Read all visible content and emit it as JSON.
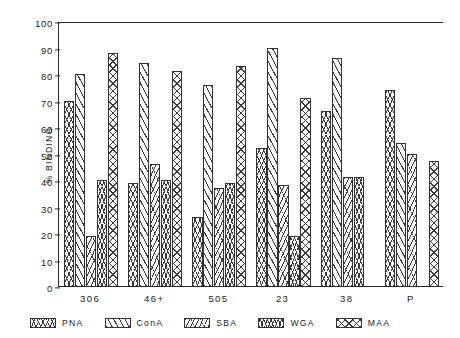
{
  "chart_data": {
    "type": "bar",
    "title": "",
    "xlabel": "",
    "ylabel": "% BINDING",
    "ylim": [
      0,
      100
    ],
    "ytick_step": 10,
    "grid": false,
    "legend_position": "bottom",
    "categories": [
      "306",
      "46+",
      "505",
      "23",
      "38",
      "P"
    ],
    "yticks": [
      "100",
      "90",
      "80",
      "70",
      "60",
      "50",
      "40",
      "30",
      "20",
      "10",
      "0"
    ],
    "series": [
      {
        "name": "PNA",
        "pattern": "chevron-cross-hatch",
        "values": [
          70,
          39,
          26,
          52,
          66,
          74
        ]
      },
      {
        "name": "ConA",
        "pattern": "diagonal-hatch",
        "values": [
          80,
          84,
          76,
          90,
          86,
          54
        ]
      },
      {
        "name": "SBA",
        "pattern": "fine-diagonal-hatch",
        "values": [
          19,
          46,
          37,
          38,
          41,
          50
        ]
      },
      {
        "name": "WGA",
        "pattern": "dense-cross-hatch",
        "values": [
          40,
          40,
          39,
          19,
          41,
          0
        ]
      },
      {
        "name": "MAA",
        "pattern": "x-cross-hatch",
        "values": [
          88,
          81,
          83,
          71,
          0,
          47
        ]
      }
    ]
  },
  "legend": {
    "items": [
      {
        "label": "PNA"
      },
      {
        "label": "ConA"
      },
      {
        "label": "SBA"
      },
      {
        "label": "WGA"
      },
      {
        "label": "MAA"
      }
    ]
  },
  "colors": {
    "axis": "#2a2a2a",
    "text": "#1d1d1d",
    "hatch": "#3a3a3a",
    "background": "#ffffff"
  }
}
